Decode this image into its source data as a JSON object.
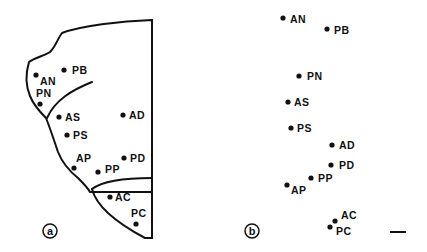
{
  "panels": {
    "a": {
      "label": "a",
      "points": [
        {
          "name": "AN",
          "label": "AN"
        },
        {
          "name": "PB",
          "label": "PB"
        },
        {
          "name": "PN",
          "label": "PN"
        },
        {
          "name": "AS",
          "label": "AS"
        },
        {
          "name": "AD",
          "label": "AD"
        },
        {
          "name": "PS",
          "label": "PS"
        },
        {
          "name": "AP",
          "label": "AP"
        },
        {
          "name": "PD",
          "label": "PD"
        },
        {
          "name": "PP",
          "label": "PP"
        },
        {
          "name": "AC",
          "label": "AC"
        },
        {
          "name": "PC",
          "label": "PC"
        }
      ]
    },
    "b": {
      "label": "b",
      "points": [
        {
          "name": "AN",
          "label": "AN"
        },
        {
          "name": "PB",
          "label": "PB"
        },
        {
          "name": "PN",
          "label": "PN"
        },
        {
          "name": "AS",
          "label": "AS"
        },
        {
          "name": "PS",
          "label": "PS"
        },
        {
          "name": "AD",
          "label": "AD"
        },
        {
          "name": "PD",
          "label": "PD"
        },
        {
          "name": "PP",
          "label": "PP"
        },
        {
          "name": "AP",
          "label": "AP"
        },
        {
          "name": "AC",
          "label": "AC"
        },
        {
          "name": "PC",
          "label": "PC"
        }
      ]
    }
  },
  "colors": {
    "ink": "#111111",
    "background": "#ffffff"
  }
}
